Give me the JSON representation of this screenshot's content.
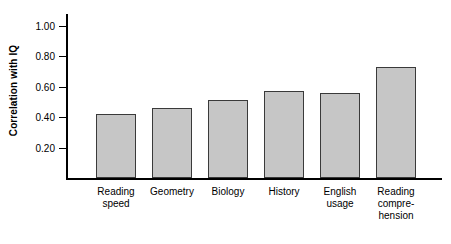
{
  "chart_data": {
    "type": "bar",
    "title": "",
    "xlabel": "",
    "ylabel": "Correlation with IQ",
    "ylim": [
      0.0,
      1.0
    ],
    "grid": false,
    "legend": false,
    "ytick_labels": [
      "1.00",
      "0.80",
      "0.60",
      "0.40",
      "0.20"
    ],
    "ytick_values": [
      1.0,
      0.8,
      0.6,
      0.4,
      0.2
    ],
    "categories": [
      "Reading speed",
      "Geometry",
      "Biology",
      "History",
      "English usage",
      "Reading comprehension"
    ],
    "category_lines": [
      [
        "Reading",
        "speed"
      ],
      [
        "Geometry"
      ],
      [
        "Biology"
      ],
      [
        "History"
      ],
      [
        "English",
        "usage"
      ],
      [
        "Reading",
        "compre-",
        "hension"
      ]
    ],
    "values": [
      0.42,
      0.46,
      0.51,
      0.57,
      0.56,
      0.73
    ],
    "bar_fill_color": "#c6c6c6",
    "bar_edge_color": "#3a3a3a",
    "axis_color": "#000000",
    "background_color": "#ffffff"
  }
}
